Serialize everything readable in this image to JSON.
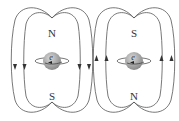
{
  "diagram": {
    "type": "magnetic-field-lines-electron-spin",
    "panels": [
      {
        "id": "left",
        "top_pole": "N",
        "bottom_pole": "S",
        "particle_label": "e",
        "field_arrow_direction": "down"
      },
      {
        "id": "right",
        "top_pole": "S",
        "bottom_pole": "N",
        "particle_label": "e",
        "field_arrow_direction": "up"
      }
    ],
    "colors": {
      "line": "#555555",
      "sphere": "#9a9a9a",
      "sphere_highlight": "#d0d0d0",
      "text": "#333333"
    }
  }
}
